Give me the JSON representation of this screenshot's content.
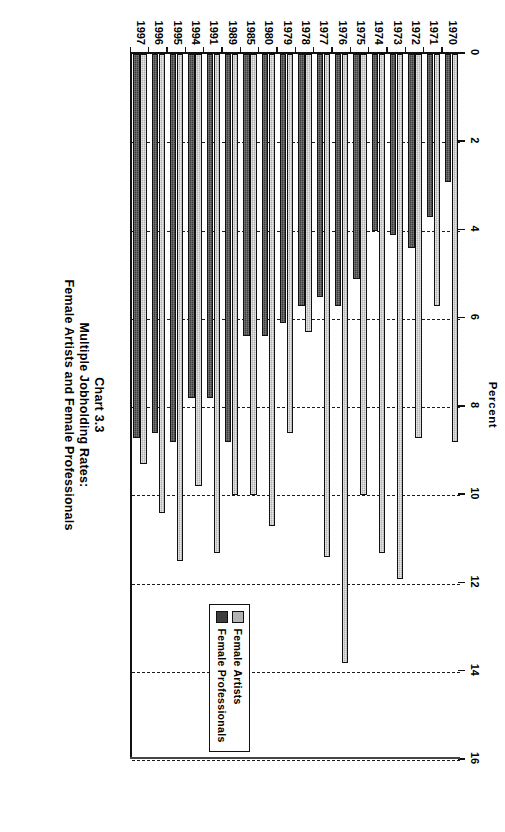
{
  "chart_data": {
    "type": "bar",
    "orientation": "horizontal",
    "title_lines": [
      "Chart 3.3",
      "Multiple Jobholding Rates:",
      "Female Artists and Female Professionals"
    ],
    "xlabel": "Percent",
    "ylabel": "",
    "xlim": [
      0,
      16
    ],
    "xticks": [
      0,
      2,
      4,
      6,
      8,
      10,
      12,
      14,
      16
    ],
    "xtick_labels": [
      "0",
      "2",
      "4",
      "6",
      "8",
      "10",
      "12",
      "14",
      "16"
    ],
    "grid": "vertical-dashed",
    "legend_position": "right",
    "categories": [
      "1970",
      "1971",
      "1972",
      "1973",
      "1974",
      "1975",
      "1976",
      "1977",
      "1978",
      "1979",
      "1980",
      "1985",
      "1989",
      "1991",
      "1994",
      "1995",
      "1996",
      "1997"
    ],
    "series": [
      {
        "name": "Female Artists",
        "color": "#b3b3b3",
        "values": [
          8.8,
          5.7,
          8.7,
          11.9,
          11.3,
          10.0,
          13.8,
          11.4,
          6.3,
          8.6,
          10.7,
          10.0,
          10.0,
          11.3,
          9.8,
          11.5,
          10.4,
          9.3
        ]
      },
      {
        "name": "Female Professionals",
        "color": "#3d3d3d",
        "values": [
          2.9,
          3.7,
          4.4,
          4.1,
          4.0,
          5.1,
          5.7,
          5.5,
          5.7,
          6.1,
          6.4,
          6.4,
          8.8,
          7.8,
          7.8,
          8.8,
          8.6,
          8.7
        ]
      }
    ]
  },
  "legend": {
    "items": [
      {
        "label": "Female Artists",
        "swatch": "artists"
      },
      {
        "label": "Female Professionals",
        "swatch": "professionals"
      }
    ]
  }
}
